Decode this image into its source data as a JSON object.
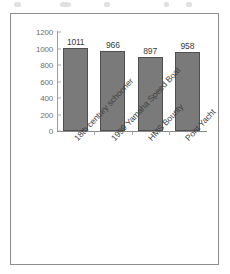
{
  "figure": {
    "background_color": "#ffffff",
    "frame_color": "#8d8d8d"
  },
  "chart_data": {
    "type": "bar",
    "title": "",
    "subtitle": "",
    "xlabel": "",
    "ylabel": "",
    "categories": [
      "18th century schooner",
      "1999 Yamaha Speed Boat",
      "HMS Bounty",
      "Pont Yacht"
    ],
    "values": [
      1011,
      966,
      897,
      958
    ],
    "data_labels": [
      "1011",
      "966",
      "897",
      "958"
    ],
    "ylim": [
      0,
      1200
    ],
    "ytick_values": [
      0,
      200,
      400,
      600,
      800,
      1000,
      1200
    ],
    "ytick_labels": [
      "0",
      "200",
      "400",
      "600",
      "800",
      "1000",
      "1200"
    ],
    "grid": false,
    "legend": null,
    "legend_position": "none",
    "orientation": "vertical",
    "bar_color": "#7a7a7a",
    "bar_edge_color": "#4f4f4f",
    "axis_color": "#9b9b9b",
    "tick_label_color": "#6f6f6f",
    "category_label_rotation": -47
  }
}
